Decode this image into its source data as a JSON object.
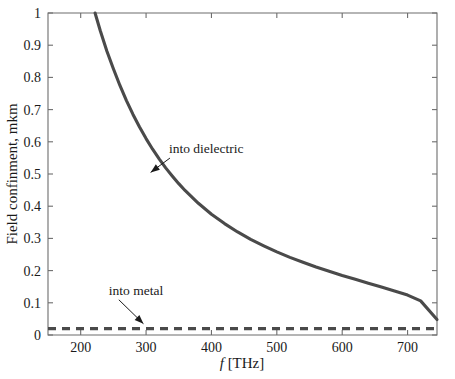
{
  "chart_data": {
    "type": "line",
    "title": "",
    "xlabel": "f [THz]",
    "xlabel_symbol": "f",
    "xlabel_unit": "[THz]",
    "ylabel": "Field confinment, mkm",
    "xlim": [
      150,
      745
    ],
    "ylim": [
      0,
      1
    ],
    "grid": false,
    "legend_position": "none",
    "xticks": [
      200,
      300,
      400,
      500,
      600,
      700
    ],
    "xtick_labels": [
      "200",
      "300",
      "400",
      "500",
      "600",
      "700"
    ],
    "yticks": [
      0,
      0.1,
      0.2,
      0.3,
      0.4,
      0.5,
      0.6,
      0.7,
      0.8,
      0.9,
      1
    ],
    "ytick_labels": [
      "0",
      "0.1",
      "0.2",
      "0.3",
      "0.4",
      "0.5",
      "0.6",
      "0.7",
      "0.8",
      "0.9",
      "1"
    ],
    "series": [
      {
        "name": "into dielectric",
        "style": "solid",
        "color": "#4a4a4a",
        "x": [
          222,
          230,
          240,
          250,
          260,
          270,
          280,
          290,
          300,
          310,
          320,
          330,
          340,
          350,
          360,
          380,
          400,
          420,
          440,
          460,
          480,
          500,
          520,
          540,
          560,
          580,
          600,
          620,
          640,
          660,
          680,
          700,
          720,
          745
        ],
        "y": [
          1.0,
          0.945,
          0.882,
          0.827,
          0.775,
          0.728,
          0.685,
          0.646,
          0.61,
          0.577,
          0.547,
          0.519,
          0.494,
          0.47,
          0.448,
          0.409,
          0.375,
          0.346,
          0.32,
          0.297,
          0.277,
          0.258,
          0.241,
          0.226,
          0.211,
          0.198,
          0.185,
          0.173,
          0.161,
          0.149,
          0.137,
          0.124,
          0.106,
          0.048
        ]
      },
      {
        "name": "into metal",
        "style": "dashed",
        "color": "#4a4a4a",
        "x": [
          150,
          745
        ],
        "y": [
          0.02,
          0.02
        ]
      }
    ],
    "annotations": [
      {
        "text": "into dielectric",
        "text_x": 335,
        "text_y": 0.565,
        "arrow_tip_x": 307,
        "arrow_tip_y": 0.505,
        "target_series": "into dielectric"
      },
      {
        "text": "into metal",
        "text_x": 243,
        "text_y": 0.125,
        "arrow_tip_x": 296,
        "arrow_tip_y": 0.035,
        "target_series": "into metal"
      }
    ]
  }
}
